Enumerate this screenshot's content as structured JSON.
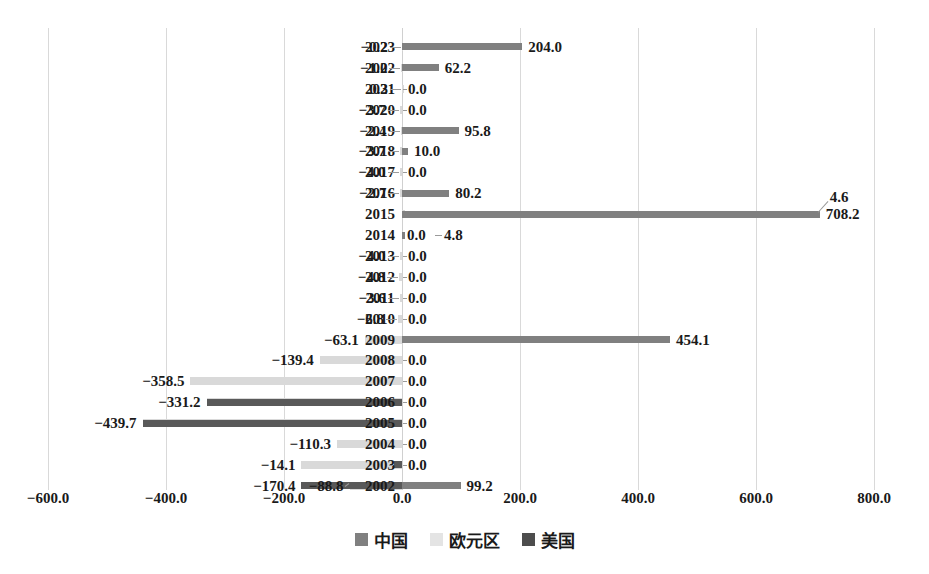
{
  "chart_data": {
    "type": "bar",
    "orientation": "horizontal",
    "title": "",
    "xlabel": "",
    "ylabel": "",
    "xlim": [
      -600,
      800
    ],
    "xticks": [
      -600,
      -400,
      -200,
      0,
      200,
      400,
      600,
      800
    ],
    "xticklabels": [
      "−600.0",
      "−400.0",
      "−200.0",
      "0.0",
      "200.0",
      "400.0",
      "600.0",
      "800.0"
    ],
    "grid": true,
    "legend_position": "bottom",
    "categories": [
      "2023",
      "2022",
      "2021",
      "2020",
      "2019",
      "2018",
      "2017",
      "2016",
      "2015",
      "2014",
      "2013",
      "2012",
      "2011",
      "2010",
      "2009",
      "2008",
      "2007",
      "2006",
      "2005",
      "2004",
      "2003",
      "2002"
    ],
    "series": [
      {
        "name": "中国",
        "color": "#808080",
        "values": [
          204.0,
          62.2,
          0.0,
          0.0,
          95.8,
          10.0,
          0.0,
          80.2,
          708.2,
          4.8,
          0.0,
          0.0,
          0.0,
          0.0,
          454.1,
          0.0,
          0.0,
          0.0,
          0.0,
          0.0,
          0.0,
          99.2
        ]
      },
      {
        "name": "欧元区",
        "color": "#d9d9d9",
        "values": [
          -0.2,
          -1.0,
          0.3,
          -3.7,
          -2.4,
          -3.7,
          -4.0,
          -2.7,
          4.6,
          0.0,
          -4.0,
          -4.8,
          -3.6,
          -6.8,
          -63.1,
          -139.4,
          -358.5,
          -331.2,
          -439.7,
          -110.3,
          -170.4,
          -88.8
        ]
      },
      {
        "name": "美国",
        "color": "#595959",
        "values": [
          0.0,
          0.0,
          0.0,
          0.0,
          0.0,
          0.0,
          0.0,
          0.0,
          0.0,
          0.0,
          0.0,
          0.0,
          0.0,
          0.0,
          0.0,
          0.0,
          0.0,
          -331.2,
          -439.7,
          0.0,
          -14.1,
          -170.4
        ]
      }
    ],
    "data_labels_right": [
      "204.0",
      "62.2",
      "0.0",
      "0.0",
      "95.8",
      "10.0",
      "0.0",
      "80.2",
      "708.2",
      "4.8",
      "0.0",
      "0.0",
      "0.0",
      "0.0",
      "454.1",
      "0.0",
      "0.0",
      "0.0",
      "0.0",
      "0.0",
      "0.0",
      "99.2"
    ],
    "data_labels_left": [
      "−0.2",
      "−1.0",
      "0.3",
      "−3.7",
      "−2.4",
      "−3.7",
      "−4.0",
      "−2.7",
      "4.6",
      "0.0",
      "−4.0",
      "−4.8",
      "−3.6",
      "−6.8",
      "−63.1",
      "−139.4",
      "−358.5",
      "−331.2",
      "−439.7",
      "−110.3",
      "−14.1",
      "−170.4"
    ]
  },
  "legend": {
    "items": [
      {
        "label": "中国",
        "color": "#808080"
      },
      {
        "label": "欧元区",
        "color": "#e4e4e4"
      },
      {
        "label": "美国",
        "color": "#4d4d4d"
      }
    ]
  },
  "axis": {
    "ticks": [
      {
        "label": "−600.0",
        "value": -600
      },
      {
        "label": "−400.0",
        "value": -400
      },
      {
        "label": "−200.0",
        "value": -200
      },
      {
        "label": "0.0",
        "value": 0
      },
      {
        "label": "200.0",
        "value": 200
      },
      {
        "label": "400.0",
        "value": 400
      },
      {
        "label": "600.0",
        "value": 600
      },
      {
        "label": "800.0",
        "value": 800
      }
    ]
  },
  "rows": [
    {
      "year": "2023",
      "left": "−0.2",
      "right": "204.0"
    },
    {
      "year": "2022",
      "left": "−1.0",
      "right": "62.2"
    },
    {
      "year": "2021",
      "left": "0.3",
      "right": "0.0"
    },
    {
      "year": "2020",
      "left": "−3.7",
      "right": "0.0"
    },
    {
      "year": "2019",
      "left": "−2.4",
      "right": "95.8"
    },
    {
      "year": "2018",
      "left": "−3.7",
      "right": "10.0"
    },
    {
      "year": "2017",
      "left": "−4.0",
      "right": "0.0"
    },
    {
      "year": "2016",
      "left": "−2.7",
      "right": "80.2"
    },
    {
      "year": "2015",
      "left": "4.6",
      "right": "708.2"
    },
    {
      "year": "2014",
      "left": "0.0",
      "right": "4.8"
    },
    {
      "year": "2013",
      "left": "−4.0",
      "right": "0.0"
    },
    {
      "year": "2012",
      "left": "−4.8",
      "right": "0.0"
    },
    {
      "year": "2011",
      "left": "−3.6",
      "right": "0.0"
    },
    {
      "year": "2010",
      "left": "−6.8",
      "right": "0.0"
    },
    {
      "year": "2009",
      "left": "−63.1",
      "right": "454.1"
    },
    {
      "year": "2008",
      "left": "−139.4",
      "right": "0.0"
    },
    {
      "year": "2007",
      "left": "−358.5",
      "right": "0.0"
    },
    {
      "year": "2006",
      "left": "−331.2",
      "right": "0.0"
    },
    {
      "year": "2005",
      "left": "−439.7",
      "right": "0.0"
    },
    {
      "year": "2004",
      "left": "−110.3",
      "right": "0.0"
    },
    {
      "year": "2003",
      "left": "−14.1",
      "right": "0.0"
    },
    {
      "year": "2002",
      "left": "−170.4",
      "left2": "−88.8",
      "right": "99.2"
    }
  ]
}
